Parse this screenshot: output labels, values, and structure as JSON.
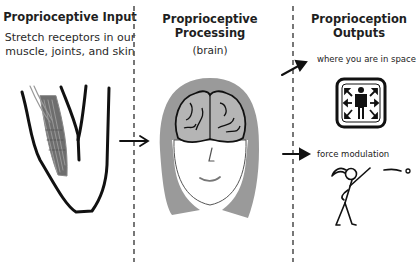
{
  "columns": [
    {
      "id": "input",
      "title": "Proprioceptive Input",
      "subtitle_line1": "Stretch receptors in our",
      "subtitle_line2": "muscle, joints, and skin",
      "illustration": "muscle-in-limb"
    },
    {
      "id": "processing",
      "title_line1": "Proprioceptive",
      "title_line2": "Processing",
      "subtitle": "(brain)",
      "illustration": "head-with-brain"
    },
    {
      "id": "outputs",
      "title_line1": "Proprioception",
      "title_line2": "Outputs",
      "items": [
        {
          "label": "where you are in space",
          "icon": "body-awareness-icon"
        },
        {
          "label": "force modulation",
          "icon": "stick-figure-throwing-ball"
        }
      ]
    }
  ],
  "colors": {
    "ink": "#111111",
    "hair": "#9a9a9a",
    "brain": "#b5b5b5",
    "muscle": "#6e6e6e",
    "divider": "#555555"
  }
}
